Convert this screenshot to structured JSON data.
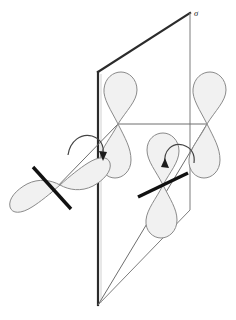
{
  "figure": {
    "background_color": "#ffffff",
    "labels": {
      "mirror_plane": "σ"
    },
    "colors": {
      "lobe_fill": "#f1f1f1",
      "lobe_stroke": "#8a8a8a",
      "bond_stroke": "#6e6e6e",
      "plane_thin_stroke": "#7d7d7d",
      "plane_thick_stroke": "#2b2b2b",
      "axis_bar": "#111111",
      "arrow": "#1c1c1c"
    },
    "plane": {
      "name": "mirror-plane",
      "shape": "parallelogram",
      "points": "98,72 190,13 190,210 98,305",
      "near_edge_emphasis": "left-vertical"
    },
    "orbitals": [
      {
        "id": "orbital-upper-inner",
        "type": "p-orbital",
        "center": [
          118,
          124
        ],
        "orientation": "vertical",
        "has_axis_bar": false
      },
      {
        "id": "orbital-right",
        "type": "p-orbital",
        "center": [
          207,
          124
        ],
        "orientation": "vertical",
        "has_axis_bar": false
      },
      {
        "id": "orbital-left-front",
        "type": "p-orbital",
        "center": [
          60,
          185
        ],
        "orientation": "tilted",
        "has_axis_bar": true
      },
      {
        "id": "orbital-lower-inner",
        "type": "p-orbital",
        "center": [
          163,
          185
        ],
        "orientation": "vertical",
        "has_axis_bar": true
      }
    ],
    "bonds": [
      {
        "id": "bond-upper-right",
        "from": [
          118,
          124
        ],
        "to": [
          207,
          124
        ]
      },
      {
        "id": "bond-upper-left",
        "from": [
          118,
          124
        ],
        "to": [
          52,
          192
        ]
      },
      {
        "id": "bond-right-lower",
        "from": [
          207,
          124
        ],
        "to": [
          98,
          305
        ]
      }
    ],
    "rotation_arrows": [
      {
        "id": "rotation-arrow-left",
        "center": [
          86,
          148
        ],
        "direction": "clockwise"
      },
      {
        "id": "rotation-arrow-right",
        "center": [
          178,
          157
        ],
        "direction": "clockwise"
      }
    ]
  }
}
